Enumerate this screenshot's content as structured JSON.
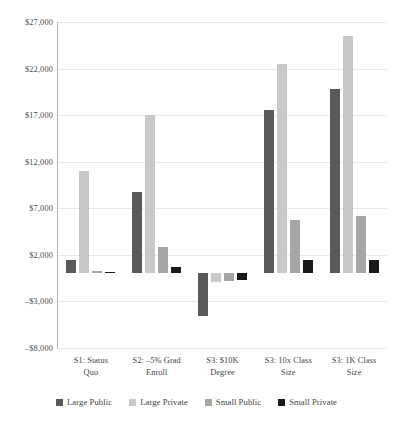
{
  "chart_data": {
    "type": "bar",
    "title": "",
    "subtitle": "",
    "xlabel": "",
    "ylabel": "",
    "ylim": [
      -8000,
      27000
    ],
    "ytick_interval": 5000,
    "ytick_labels": [
      "$27,000",
      "$22,000",
      "$17,000",
      "$12,000",
      "$7,000",
      "$2,000",
      "–$3,000",
      "–$8,000"
    ],
    "ytick_values": [
      27000,
      22000,
      17000,
      12000,
      7000,
      2000,
      -3000,
      -8000
    ],
    "grid": true,
    "legend_position": "bottom",
    "categories": [
      "S1: Status Quo",
      "S2: –5% Grad Enroll",
      "S3: $10K Degree",
      "S3: 10x Class Size",
      "S3: 1K Class Size"
    ],
    "category_lines": [
      [
        "S1: Status",
        "Quo"
      ],
      [
        "S2: –5% Grad",
        "Enroll"
      ],
      [
        "S3: $10K",
        "Degree"
      ],
      [
        "S3: 10x Class",
        "Size"
      ],
      [
        "S3: 1K Class",
        "Size"
      ]
    ],
    "series": [
      {
        "name": "Large Public",
        "color": "#595959",
        "values": [
          1400,
          8800,
          -4600,
          17600,
          19800
        ]
      },
      {
        "name": "Large Private",
        "color": "#c9c9c9",
        "values": [
          11000,
          17000,
          -900,
          22500,
          25500
        ]
      },
      {
        "name": "Small Public",
        "color": "#a6a6a6",
        "values": [
          250,
          2800,
          -800,
          5700,
          6200
        ]
      },
      {
        "name": "Small Private",
        "color": "#1a1a1a",
        "values": [
          150,
          700,
          -700,
          1400,
          1500
        ]
      }
    ]
  },
  "colors": {
    "gridline": "#e9e9e9",
    "axis": "#b4b4b4",
    "text": "#3f3f3f",
    "background": "#ffffff"
  }
}
